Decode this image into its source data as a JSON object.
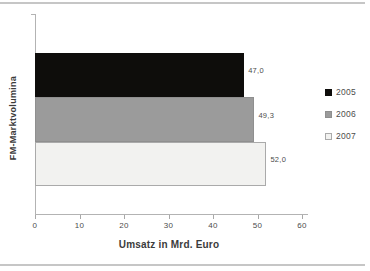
{
  "chart_data": {
    "type": "bar",
    "orientation": "horizontal",
    "title": "",
    "xlabel": "Umsatz in Mrd. Euro",
    "ylabel": "FM-Marktvolumina",
    "xlim": [
      0,
      60
    ],
    "xticks": [
      "0",
      "10",
      "20",
      "30",
      "40",
      "50",
      "60"
    ],
    "xtick_values": [
      0,
      10,
      20,
      30,
      40,
      50,
      60
    ],
    "grid": false,
    "legend_position": "right",
    "series": [
      {
        "name": "2005",
        "value": 47.0,
        "value_label": "47,0",
        "color": "#0e0d0b",
        "border": "#0e0d0b",
        "texture": ""
      },
      {
        "name": "2006",
        "value": 49.3,
        "value_label": "49,3",
        "color": "#9b9b9b",
        "border": "#8f8f8f",
        "texture": ""
      },
      {
        "name": "2007",
        "value": 52.0,
        "value_label": "52,0",
        "color": "#f2f2f0",
        "border": "#aaaaaa",
        "texture": "fine-vertical-stripes"
      }
    ]
  },
  "colors": {
    "background": "#ffffff",
    "divider_rule": "#c6c6c6",
    "axis": "#b3b3b3",
    "text": "#4c4c4c"
  }
}
